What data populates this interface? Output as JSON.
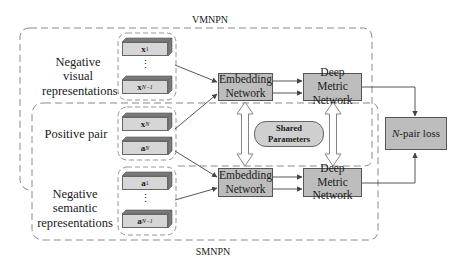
{
  "groups": {
    "vmnpn": {
      "label": "VMNPN"
    },
    "smnpn": {
      "label": "SMNPN"
    }
  },
  "side_labels": {
    "negative_visual": "Negative visual representations",
    "positive_pair": "Positive pair",
    "negative_semantic": "Negative semantic representations"
  },
  "stacks": {
    "visual_negatives": [
      {
        "symbol": "x",
        "subscript": "1"
      },
      {
        "symbol": "x",
        "subscript": "N−1"
      }
    ],
    "positive": [
      {
        "symbol": "x",
        "subscript": "N"
      },
      {
        "symbol": "a",
        "subscript": "N"
      }
    ],
    "semantic_negatives": [
      {
        "symbol": "a",
        "subscript": "1"
      },
      {
        "symbol": "a",
        "subscript": "N−1"
      }
    ],
    "ellipsis": "⋮"
  },
  "nodes": {
    "embedding_top": {
      "line1": "Embedding",
      "line2": "Network"
    },
    "metric_top": {
      "line1": "Deep Metric",
      "line2": "Network"
    },
    "embedding_bottom": {
      "line1": "Embedding",
      "line2": "Network"
    },
    "metric_bottom": {
      "line1": "Deep Metric",
      "line2": "Network"
    },
    "shared": {
      "line1": "Shared",
      "line2": "Parameters"
    },
    "loss": {
      "italic": "N",
      "rest": "-pair loss"
    }
  },
  "colors": {
    "box_fill": "#bdbdbd",
    "stack_face": "#d6d6d6",
    "stack_top": "#7a7a7a",
    "dashed_border": "#8a8a8a",
    "arrow": "#444444"
  }
}
